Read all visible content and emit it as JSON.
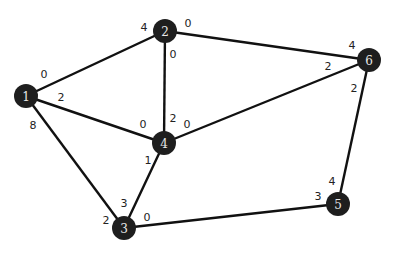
{
  "graph": {
    "nodes": [
      {
        "id": "1",
        "label": "1",
        "x": 26,
        "y": 96
      },
      {
        "id": "2",
        "label": "2",
        "x": 165,
        "y": 31
      },
      {
        "id": "3",
        "label": "3",
        "x": 124,
        "y": 228
      },
      {
        "id": "4",
        "label": "4",
        "x": 164,
        "y": 143
      },
      {
        "id": "5",
        "label": "5",
        "x": 338,
        "y": 204
      },
      {
        "id": "6",
        "label": "6",
        "x": 369,
        "y": 60
      }
    ],
    "edges": [
      {
        "from": "1",
        "to": "2",
        "label_from": "0",
        "label_to": "4"
      },
      {
        "from": "1",
        "to": "4",
        "label_from": "2",
        "label_to": "0"
      },
      {
        "from": "1",
        "to": "3",
        "label_from": "8",
        "label_to": "2"
      },
      {
        "from": "2",
        "to": "6",
        "label_from": "0",
        "label_to": "4"
      },
      {
        "from": "2",
        "to": "4",
        "label_from": "0",
        "label_to": "2"
      },
      {
        "from": "4",
        "to": "6",
        "label_from": "0",
        "label_to": "2"
      },
      {
        "from": "4",
        "to": "3",
        "label_from": "1",
        "label_to": "3"
      },
      {
        "from": "3",
        "to": "5",
        "label_from": "0",
        "label_to": "3"
      },
      {
        "from": "6",
        "to": "5",
        "label_from": "2",
        "label_to": "4"
      }
    ],
    "weight_labels": [
      {
        "text": "0",
        "x": 44,
        "y": 74
      },
      {
        "text": "2",
        "x": 61,
        "y": 97
      },
      {
        "text": "8",
        "x": 33,
        "y": 125
      },
      {
        "text": "4",
        "x": 144,
        "y": 27
      },
      {
        "text": "0",
        "x": 188,
        "y": 23
      },
      {
        "text": "0",
        "x": 173,
        "y": 54
      },
      {
        "text": "2",
        "x": 173,
        "y": 118
      },
      {
        "text": "0",
        "x": 143,
        "y": 124
      },
      {
        "text": "0",
        "x": 187,
        "y": 124
      },
      {
        "text": "1",
        "x": 148,
        "y": 160
      },
      {
        "text": "4",
        "x": 352,
        "y": 45
      },
      {
        "text": "2",
        "x": 328,
        "y": 66
      },
      {
        "text": "2",
        "x": 354,
        "y": 88
      },
      {
        "text": "3",
        "x": 124,
        "y": 203
      },
      {
        "text": "2",
        "x": 106,
        "y": 220
      },
      {
        "text": "0",
        "x": 147,
        "y": 217
      },
      {
        "text": "4",
        "x": 332,
        "y": 181
      },
      {
        "text": "3",
        "x": 318,
        "y": 196
      }
    ]
  }
}
